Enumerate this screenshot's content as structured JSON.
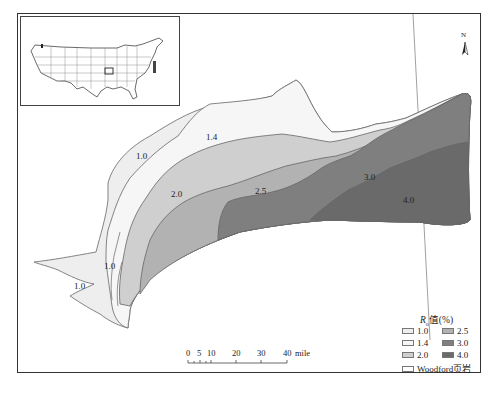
{
  "figure": {
    "title": "",
    "caption": "",
    "colors": {
      "ro_1_0": "#eeeeee",
      "ro_1_4": "#f6f6f6",
      "ro_2_0": "#cfcfcf",
      "ro_2_5": "#b2b2b2",
      "ro_3_0": "#7f7f7f",
      "ro_4_0": "#6a6a6a",
      "woodford": "#ffffff",
      "outline": "#666666"
    }
  },
  "inset_map": {
    "label": "United States locator map"
  },
  "north_arrow": {
    "label": "N"
  },
  "zone_labels": [
    {
      "text": "1.0",
      "x": 136,
      "y": 151
    },
    {
      "text": "1.4",
      "x": 206,
      "y": 132
    },
    {
      "text": "2.0",
      "x": 171,
      "y": 189
    },
    {
      "text": "2.5",
      "x": 255,
      "y": 186
    },
    {
      "text": "3.0",
      "x": 364,
      "y": 172
    },
    {
      "text": "4.0",
      "x": 403,
      "y": 195
    },
    {
      "text": "1.0",
      "x": 104,
      "y": 261
    },
    {
      "text": "1.0",
      "x": 74,
      "y": 281
    }
  ],
  "legend": {
    "title_prefix": "R",
    "title_sub": "o",
    "title_suffix": "值(%)",
    "items": [
      {
        "label": "1.0",
        "color": "#eeeeee"
      },
      {
        "label": "1.4",
        "color": "#f6f6f6"
      },
      {
        "label": "2.0",
        "color": "#cfcfcf"
      },
      {
        "label": "2.5",
        "color": "#b2b2b2"
      },
      {
        "label": "3.0",
        "color": "#7f7f7f"
      },
      {
        "label": "4.0",
        "color": "#6a6a6a"
      },
      {
        "label": "Woodford页岩",
        "color": "#ffffff"
      }
    ]
  },
  "scale_bar": {
    "ticks": [
      "0",
      "5",
      "10",
      "20",
      "30",
      "40"
    ],
    "unit": "mile"
  }
}
